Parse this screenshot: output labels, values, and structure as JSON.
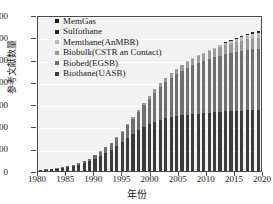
{
  "chart_data": {
    "type": "bar",
    "stacked": true,
    "title": "",
    "xlabel": "年份",
    "ylabel": "参考文献数量",
    "xlim": [
      1980,
      2020
    ],
    "ylim": [
      0,
      700
    ],
    "ytick_labels": [
      "0",
      "100",
      "200",
      "300",
      "400",
      "500",
      "600",
      "700"
    ],
    "ytick_values": [
      0,
      100,
      200,
      300,
      400,
      500,
      600,
      700
    ],
    "xtick_labels": [
      "1980",
      "1985",
      "1990",
      "1995",
      "2000",
      "2005",
      "2010",
      "2015",
      "2020"
    ],
    "xtick_values": [
      1980,
      1985,
      1990,
      1995,
      2000,
      2005,
      2010,
      2015,
      2020
    ],
    "grid": true,
    "legend_position": "upper left",
    "categories": [
      1980,
      1981,
      1982,
      1983,
      1984,
      1985,
      1986,
      1987,
      1988,
      1989,
      1990,
      1991,
      1992,
      1993,
      1994,
      1995,
      1996,
      1997,
      1998,
      1999,
      2000,
      2001,
      2002,
      2003,
      2004,
      2005,
      2006,
      2007,
      2008,
      2009,
      2010,
      2011,
      2012,
      2013,
      2014,
      2015,
      2016,
      2017,
      2018,
      2019,
      2020
    ],
    "series": [
      {
        "name": "Biothane(UASB)",
        "color": "#3b3b3b",
        "values": [
          4,
          6,
          8,
          10,
          13,
          17,
          22,
          28,
          35,
          44,
          55,
          68,
          82,
          96,
          112,
          130,
          148,
          165,
          182,
          196,
          209,
          220,
          229,
          236,
          242,
          247,
          250,
          253,
          256,
          258,
          260,
          262,
          264,
          266,
          268,
          269,
          270,
          271,
          272,
          273,
          274
        ]
      },
      {
        "name": "Biobed(EGSB)",
        "color": "#6f6f6f",
        "values": [
          1,
          1,
          2,
          2,
          3,
          4,
          5,
          7,
          9,
          12,
          15,
          19,
          24,
          30,
          38,
          47,
          58,
          70,
          84,
          99,
          115,
          132,
          148,
          163,
          177,
          190,
          201,
          211,
          220,
          228,
          235,
          241,
          247,
          252,
          257,
          261,
          265,
          268,
          271,
          273,
          274
        ]
      },
      {
        "name": "Biobulk(CSTR an Contact)",
        "color": "#9a9a9a",
        "values": [
          0,
          0,
          0,
          0,
          0,
          0,
          0,
          0,
          0,
          0,
          1,
          1,
          2,
          2,
          3,
          4,
          5,
          6,
          8,
          10,
          12,
          14,
          16,
          18,
          20,
          22,
          24,
          26,
          28,
          30,
          32,
          34,
          36,
          38,
          40,
          42,
          44,
          46,
          48,
          50,
          50
        ]
      },
      {
        "name": "Memthane(AnMBR)",
        "color": "#b8b8b8",
        "values": [
          0,
          0,
          0,
          0,
          0,
          0,
          0,
          0,
          0,
          0,
          0,
          0,
          0,
          0,
          0,
          0,
          0,
          0,
          0,
          0,
          0,
          0,
          0,
          0,
          0,
          1,
          1,
          2,
          2,
          3,
          4,
          5,
          6,
          8,
          10,
          12,
          14,
          16,
          18,
          20,
          20
        ]
      },
      {
        "name": "Sulfothane",
        "color": "#2a2a2a",
        "values": [
          0,
          0,
          0,
          0,
          0,
          0,
          0,
          0,
          0,
          0,
          0,
          0,
          0,
          0,
          0,
          0,
          0,
          0,
          0,
          0,
          0,
          0,
          0,
          0,
          0,
          0,
          0,
          0,
          0,
          0,
          0,
          0,
          0,
          1,
          2,
          3,
          4,
          5,
          6,
          7,
          7
        ]
      },
      {
        "name": "MemGas",
        "color": "#1a1a1a",
        "values": [
          0,
          0,
          0,
          0,
          0,
          0,
          0,
          0,
          0,
          0,
          0,
          0,
          0,
          0,
          0,
          0,
          0,
          0,
          0,
          0,
          0,
          0,
          0,
          0,
          0,
          0,
          0,
          0,
          0,
          0,
          0,
          0,
          0,
          0,
          0,
          1,
          1,
          2,
          2,
          2,
          2
        ]
      }
    ],
    "totals": [
      5,
      7,
      10,
      12,
      16,
      21,
      27,
      35,
      44,
      56,
      71,
      88,
      108,
      128,
      153,
      181,
      211,
      241,
      274,
      305,
      336,
      366,
      393,
      417,
      439,
      460,
      476,
      492,
      506,
      519,
      531,
      542,
      553,
      565,
      577,
      588,
      598,
      608,
      617,
      625,
      627
    ],
    "peak_value": 627,
    "peak_year": 2020
  },
  "legend": {
    "items": [
      {
        "label": "MemGas",
        "color": "#1a1a1a"
      },
      {
        "label": "Sulfothane",
        "color": "#2a2a2a"
      },
      {
        "label": "Memthane(AnMBR)",
        "color": "#b8b8b8"
      },
      {
        "label": "Biobulk(CSTR an Contact)",
        "color": "#9a9a9a"
      },
      {
        "label": "Biobed(EGSB)",
        "color": "#6f6f6f"
      },
      {
        "label": "Biothane(UASB)",
        "color": "#3b3b3b"
      }
    ]
  }
}
